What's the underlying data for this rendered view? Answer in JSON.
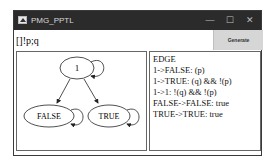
{
  "window": {
    "title": "PMG_PPTL",
    "controls": {
      "minimize": "—",
      "maximize": "☐",
      "close": "✕"
    }
  },
  "formula": {
    "value": "[]!p;q"
  },
  "toolbar": {
    "generate_label": "Generate"
  },
  "graph": {
    "nodes": [
      {
        "id": "1",
        "label": "1"
      },
      {
        "id": "FALSE",
        "label": "FALSE"
      },
      {
        "id": "TRUE",
        "label": "TRUE"
      }
    ],
    "edges": [
      {
        "from": "1",
        "to": "1"
      },
      {
        "from": "1",
        "to": "FALSE"
      },
      {
        "from": "1",
        "to": "TRUE"
      },
      {
        "from": "FALSE",
        "to": "FALSE"
      },
      {
        "from": "TRUE",
        "to": "TRUE"
      }
    ]
  },
  "edges_panel": {
    "header": "EDGE",
    "lines": [
      "1->FALSE:  (p)",
      "1->TRUE:  (q) && !(p)",
      "1->1:  !(q) && !(p)",
      "FALSE->FALSE: true",
      "TRUE->TRUE: true"
    ]
  }
}
